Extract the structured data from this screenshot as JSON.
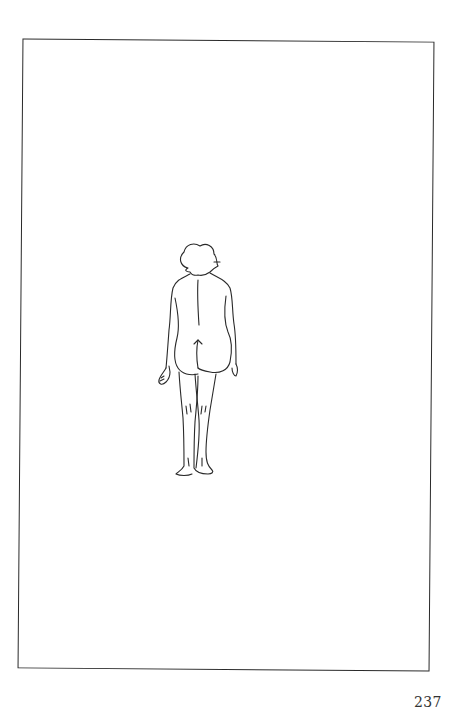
{
  "page": {
    "number": "237",
    "illustration": {
      "subject": "standing-figure-back-view",
      "style": "line-drawing"
    },
    "colors": {
      "background": "#ffffff",
      "line": "#2a2a2a",
      "text": "#333333"
    }
  }
}
